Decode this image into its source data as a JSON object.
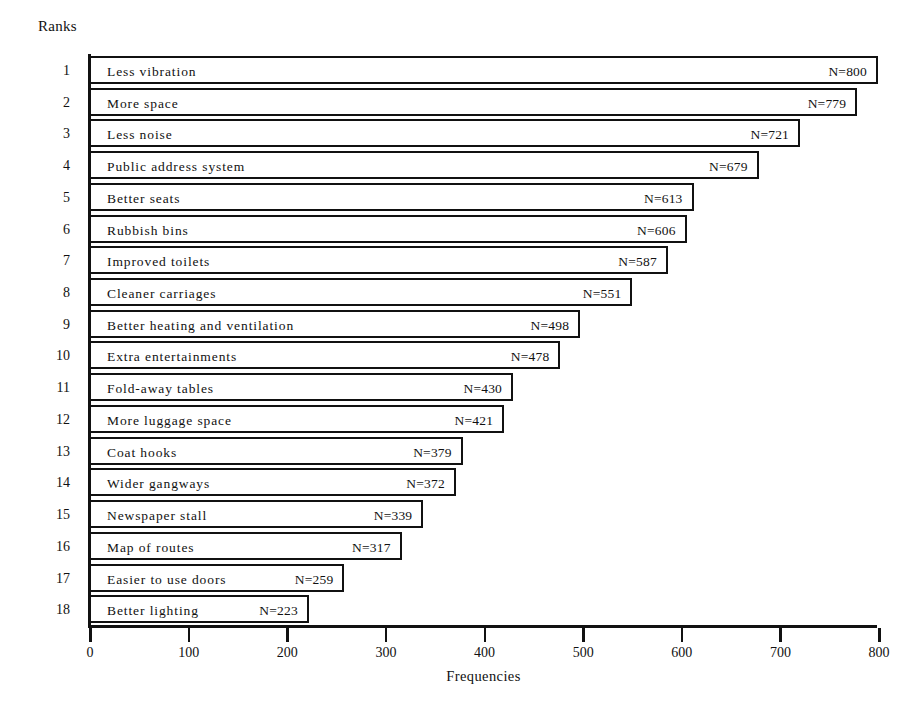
{
  "chart_title_left": "Ranks",
  "axis": {
    "x_title": "Frequencies",
    "x_ticks": [
      "0",
      "100",
      "200",
      "300",
      "400",
      "500",
      "600",
      "700",
      "800"
    ]
  },
  "chart_data": {
    "type": "bar",
    "orientation": "horizontal",
    "title": "",
    "xlabel": "Frequencies",
    "ylabel": "Ranks",
    "xlim": [
      0,
      800
    ],
    "xticks": [
      0,
      100,
      200,
      300,
      400,
      500,
      600,
      700,
      800
    ],
    "grid": false,
    "legend": "none",
    "value_label_prefix": "N=",
    "categories": [
      "Less vibration",
      "More space",
      "Less noise",
      "Public address system",
      "Better seats",
      "Rubbish bins",
      "Improved toilets",
      "Cleaner carriages",
      "Better heating and ventilation",
      "Extra entertainments",
      "Fold-away tables",
      "More luggage space",
      "Coat hooks",
      "Wider gangways",
      "Newspaper stall",
      "Map of routes",
      "Easier to use doors",
      "Better lighting"
    ],
    "values": [
      800,
      779,
      721,
      679,
      613,
      606,
      587,
      551,
      498,
      478,
      430,
      421,
      379,
      372,
      339,
      317,
      259,
      223
    ],
    "ranks": [
      1,
      2,
      3,
      4,
      5,
      6,
      7,
      8,
      9,
      10,
      11,
      12,
      13,
      14,
      15,
      16,
      17,
      18
    ],
    "value_labels": [
      "N=800",
      "N=779",
      "N=721",
      "N=679",
      "N=613",
      "N=606",
      "N=587",
      "N=551",
      "N=498",
      "N=478",
      "N=430",
      "N=421",
      "N=379",
      "N=372",
      "N=339",
      "N=317",
      "N=259",
      "N=223"
    ]
  },
  "colors": {
    "ink": "#111111",
    "paper": "#ffffff"
  }
}
